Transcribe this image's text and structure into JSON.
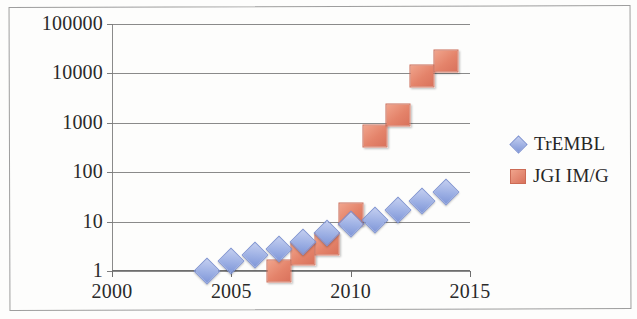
{
  "chart_data": {
    "type": "scatter",
    "title": "",
    "xlabel": "",
    "ylabel": "",
    "x_ticks": [
      "2000",
      "2005",
      "2010",
      "2015"
    ],
    "x_tick_values": [
      2000,
      2005,
      2010,
      2015
    ],
    "xlim": [
      2000,
      2015
    ],
    "y_ticks": [
      "1",
      "10",
      "100",
      "1000",
      "10000",
      "100000"
    ],
    "y_tick_values": [
      1,
      10,
      100,
      1000,
      10000,
      100000
    ],
    "ylim": [
      1,
      100000
    ],
    "y_scale": "log",
    "grid": "horizontal",
    "legend_position": "right",
    "series": [
      {
        "name": "TrEMBL",
        "marker": "diamond",
        "color": "#8097d8",
        "x": [
          2004,
          2005,
          2006,
          2007,
          2008,
          2009,
          2010,
          2011,
          2012,
          2013,
          2014
        ],
        "values": [
          1,
          1.6,
          2.1,
          2.8,
          3.8,
          6,
          9,
          11,
          17,
          26,
          40
        ]
      },
      {
        "name": "JGI IM/G",
        "marker": "square",
        "color": "#e4836a",
        "x": [
          2007,
          2008,
          2009,
          2010,
          2011,
          2012,
          2013,
          2014
        ],
        "values": [
          1,
          2.2,
          3.5,
          14,
          550,
          1450,
          9000,
          18000
        ]
      }
    ]
  }
}
